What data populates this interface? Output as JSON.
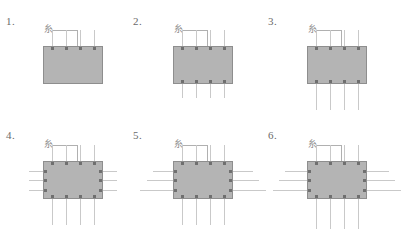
{
  "figure": {
    "title": "",
    "background_color": "#ffffff",
    "die_color": "#b4b4b4",
    "die_border_color": "#8e8e8e",
    "pin_color": "#c9c9c9",
    "pad_color": "#6f6f6f",
    "label_color": "#6a6a6a",
    "marker_color": "#8a8a8a",
    "marker_glyph": "糸"
  },
  "panels": [
    {
      "label": "1.",
      "marker": "糸",
      "die": {
        "x": 43,
        "y": 46,
        "w": 60,
        "h": 38
      },
      "label_pos": {
        "x": 6,
        "y": 16
      },
      "marker_pos": {
        "x": 44,
        "y": 25
      },
      "leader": {
        "x": 52,
        "y": 30,
        "w": 25
      },
      "leader_tick": {
        "x": 77,
        "y": 30,
        "h": 16
      },
      "top_pins": {
        "count": 4,
        "start_x": 52,
        "gap": 14,
        "length": 16
      },
      "bottom_pins": {
        "count": 0,
        "start_x": 0,
        "gap": 0,
        "length": 0
      },
      "left_pins": {
        "count": 0,
        "lengths": []
      },
      "right_pins": {
        "count": 0,
        "lengths": []
      }
    },
    {
      "label": "2.",
      "marker": "糸",
      "die": {
        "x": 173,
        "y": 46,
        "w": 60,
        "h": 38
      },
      "label_pos": {
        "x": 133,
        "y": 16
      },
      "marker_pos": {
        "x": 174,
        "y": 25
      },
      "leader": {
        "x": 182,
        "y": 30,
        "w": 25
      },
      "leader_tick": {
        "x": 207,
        "y": 30,
        "h": 16
      },
      "top_pins": {
        "count": 4,
        "start_x": 182,
        "gap": 14,
        "length": 16
      },
      "bottom_pins": {
        "count": 4,
        "start_x": 182,
        "gap": 14,
        "length": 14
      },
      "left_pins": {
        "count": 0,
        "lengths": []
      },
      "right_pins": {
        "count": 0,
        "lengths": []
      }
    },
    {
      "label": "3.",
      "marker": "糸",
      "die": {
        "x": 307,
        "y": 46,
        "w": 60,
        "h": 38
      },
      "label_pos": {
        "x": 268,
        "y": 16
      },
      "marker_pos": {
        "x": 308,
        "y": 25
      },
      "leader": {
        "x": 316,
        "y": 30,
        "w": 25
      },
      "leader_tick": {
        "x": 341,
        "y": 30,
        "h": 16
      },
      "top_pins": {
        "count": 4,
        "start_x": 316,
        "gap": 14,
        "length": 16
      },
      "bottom_pins": {
        "count": 4,
        "start_x": 316,
        "gap": 14,
        "length": 26
      },
      "left_pins": {
        "count": 0,
        "lengths": []
      },
      "right_pins": {
        "count": 0,
        "lengths": []
      }
    },
    {
      "label": "4.",
      "marker": "糸",
      "die": {
        "x": 43,
        "y": 161,
        "w": 60,
        "h": 38
      },
      "label_pos": {
        "x": 6,
        "y": 130
      },
      "marker_pos": {
        "x": 44,
        "y": 140
      },
      "leader": {
        "x": 52,
        "y": 145,
        "w": 25
      },
      "leader_tick": {
        "x": 77,
        "y": 145,
        "h": 16
      },
      "top_pins": {
        "count": 4,
        "start_x": 52,
        "gap": 14,
        "length": 16
      },
      "bottom_pins": {
        "count": 4,
        "start_x": 52,
        "gap": 14,
        "length": 26
      },
      "left_pins": {
        "count": 3,
        "lengths": [
          14,
          14,
          14
        ]
      },
      "right_pins": {
        "count": 3,
        "lengths": [
          14,
          14,
          14
        ]
      }
    },
    {
      "label": "5.",
      "marker": "糸",
      "die": {
        "x": 173,
        "y": 161,
        "w": 60,
        "h": 38
      },
      "label_pos": {
        "x": 133,
        "y": 130
      },
      "marker_pos": {
        "x": 174,
        "y": 140
      },
      "leader": {
        "x": 182,
        "y": 145,
        "w": 25
      },
      "leader_tick": {
        "x": 207,
        "y": 145,
        "h": 16
      },
      "top_pins": {
        "count": 4,
        "start_x": 182,
        "gap": 14,
        "length": 16
      },
      "bottom_pins": {
        "count": 4,
        "start_x": 182,
        "gap": 14,
        "length": 26
      },
      "left_pins": {
        "count": 3,
        "lengths": [
          20,
          26,
          33
        ]
      },
      "right_pins": {
        "count": 3,
        "lengths": [
          20,
          26,
          33
        ]
      }
    },
    {
      "label": "6.",
      "marker": "糸",
      "die": {
        "x": 307,
        "y": 161,
        "w": 60,
        "h": 38
      },
      "label_pos": {
        "x": 268,
        "y": 130
      },
      "marker_pos": {
        "x": 308,
        "y": 140
      },
      "leader": {
        "x": 316,
        "y": 145,
        "w": 25
      },
      "leader_tick": {
        "x": 341,
        "y": 145,
        "h": 16
      },
      "top_pins": {
        "count": 4,
        "start_x": 316,
        "gap": 14,
        "length": 16
      },
      "bottom_pins": {
        "count": 4,
        "start_x": 316,
        "gap": 14,
        "length": 30
      },
      "left_pins": {
        "count": 3,
        "lengths": [
          22,
          28,
          34
        ]
      },
      "right_pins": {
        "count": 3,
        "lengths": [
          22,
          28,
          34
        ]
      }
    }
  ]
}
